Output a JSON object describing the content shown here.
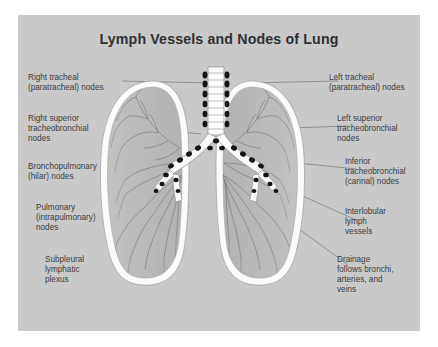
{
  "figure": {
    "title": "Lymph Vessels and Nodes of Lung",
    "panel_color": "#c9c9c9",
    "page_background": "#ffffff",
    "title_color": "#2e3033",
    "label_color": "#3a3c3f",
    "leader_color": "#6f7174",
    "lung_fill": "#b9b9b9",
    "pleura_color": "#fbfbfb",
    "node_color": "#141414",
    "vessel_color": "#5d6064"
  },
  "labels_left": [
    {
      "id": "right-tracheal",
      "text": "Right tracheal\n(paratracheal) nodes",
      "x": 28,
      "y": 78
    },
    {
      "id": "right-superior-tracheobronchial",
      "text": "Right superior\ntracheobronchial\nnodes",
      "x": 28,
      "y": 118
    },
    {
      "id": "bronchopulmonary",
      "text": "Bronchopulmonary\n(hilar) nodes",
      "x": 28,
      "y": 166
    },
    {
      "id": "pulmonary",
      "text": "Pulmonary\n(intrapulmonary)\nnodes",
      "x": 36,
      "y": 206
    },
    {
      "id": "subpleural",
      "text": "Subpleural\nlymphatic\nplexus",
      "x": 45,
      "y": 258
    }
  ],
  "labels_right": [
    {
      "id": "left-tracheal",
      "text": "Left tracheal\n(paratracheal) nodes",
      "x": 329,
      "y": 78
    },
    {
      "id": "left-superior-tracheobronchial",
      "text": "Left superior\ntracheobronchial\nnodes",
      "x": 337,
      "y": 118
    },
    {
      "id": "inferior-tracheobronchial",
      "text": "Inferior\ntracheobronchial\n(carinal) nodes",
      "x": 345,
      "y": 160
    },
    {
      "id": "interlobular",
      "text": "Interlobular\nlymph\nvessels",
      "x": 345,
      "y": 210
    },
    {
      "id": "drainage",
      "text": "Drainage\nfollows bronchi,\narteries, and\nveins",
      "x": 337,
      "y": 258
    }
  ],
  "anatomy": {
    "structures": [
      "trachea",
      "right main bronchus",
      "left main bronchus",
      "right lung",
      "left lung",
      "lymph nodes",
      "lymphatic vessels"
    ],
    "node_count_visible": 34
  }
}
